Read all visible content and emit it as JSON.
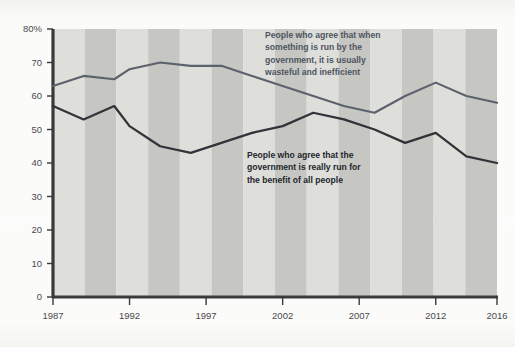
{
  "chart": {
    "type": "line",
    "background_color": "#fbfbfa",
    "axis_color": "#3a3a3a",
    "band_light_color": "#dededb",
    "band_dark_color": "#c6c6c3"
  },
  "axes": {
    "y": {
      "label_suffix": "%",
      "ticks": [
        "0",
        "10",
        "20",
        "30",
        "40",
        "50",
        "60",
        "70",
        "80%"
      ],
      "tick_values": [
        0,
        10,
        20,
        30,
        40,
        50,
        60,
        70,
        80
      ],
      "min": 0,
      "max": 80
    },
    "x": {
      "ticks": [
        "1987",
        "1992",
        "1997",
        "2002",
        "2007",
        "2012",
        "2016"
      ],
      "tick_values": [
        1987,
        1992,
        1997,
        2002,
        2007,
        2012,
        2016
      ],
      "min": 1987,
      "max": 2016
    }
  },
  "annotations": [
    {
      "name": "wasteful-inefficient-label",
      "color": "#4d5560",
      "lines": [
        "People who agree that when",
        "something is run by the",
        "government, it is usually",
        "wasteful and inefficient"
      ]
    },
    {
      "name": "benefit-of-all-label",
      "color": "#23262b",
      "lines": [
        "People who agree that the",
        "government is really run for",
        "the benefit of all people"
      ]
    }
  ],
  "chart_data": {
    "type": "line",
    "title": "",
    "subtitle": "",
    "xlabel": "",
    "ylabel": "",
    "xlim": [
      1987,
      2016
    ],
    "ylim": [
      0,
      80
    ],
    "grid": false,
    "legend_position": "inline-annotation",
    "x": [
      1987,
      1989,
      1991,
      1992,
      1994,
      1996,
      1998,
      2000,
      2002,
      2004,
      2006,
      2008,
      2010,
      2012,
      2014,
      2016
    ],
    "xtick_labels": [
      "1987",
      "1992",
      "1997",
      "2002",
      "2007",
      "2012",
      "2016"
    ],
    "ytick_labels": [
      "0",
      "10",
      "20",
      "30",
      "40",
      "50",
      "60",
      "70",
      "80%"
    ],
    "series": [
      {
        "name": "People who agree that when something is run by the government, it is usually wasteful and inefficient",
        "short_name": "wasteful-and-inefficient",
        "color": "#5c626b",
        "values": [
          63,
          66,
          65,
          68,
          70,
          69,
          69,
          66,
          63,
          60,
          57,
          55,
          60,
          64,
          60,
          58
        ]
      },
      {
        "name": "People who agree that the government is really run for the benefit of all people",
        "short_name": "benefit-of-all-people",
        "color": "#303338",
        "values": [
          57,
          53,
          57,
          51,
          45,
          43,
          46,
          49,
          51,
          55,
          53,
          50,
          46,
          49,
          42,
          40
        ]
      }
    ]
  }
}
